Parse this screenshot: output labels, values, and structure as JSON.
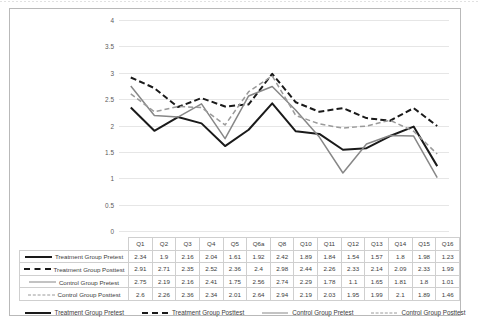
{
  "chart_data": {
    "type": "line",
    "title": "",
    "xlabel": "",
    "ylabel": "",
    "ylim": [
      0,
      4
    ],
    "yticks": [
      "0",
      "0.5",
      "1",
      "1.5",
      "2",
      "2.5",
      "3",
      "3.5",
      "4"
    ],
    "grid": true,
    "legend_position": "bottom",
    "categories": [
      "Q1",
      "Q2",
      "Q3",
      "Q4",
      "Q5",
      "Q6a",
      "Q8",
      "Q10",
      "Q11",
      "Q12",
      "Q13",
      "Q14",
      "Q15",
      "Q16"
    ],
    "series": [
      {
        "name": "Treatment Group Pretest",
        "style": "solid",
        "color": "#1a1a1a",
        "values": [
          2.34,
          1.9,
          2.16,
          2.04,
          1.61,
          1.92,
          2.42,
          1.89,
          1.84,
          1.54,
          1.57,
          1.8,
          1.98,
          1.23
        ]
      },
      {
        "name": "Treatment Group Posttest",
        "style": "dashed",
        "color": "#1a1a1a",
        "values": [
          2.91,
          2.71,
          2.35,
          2.52,
          2.36,
          2.4,
          2.98,
          2.44,
          2.26,
          2.33,
          2.14,
          2.09,
          2.33,
          1.99
        ]
      },
      {
        "name": "Control Group Pretest",
        "style": "solid",
        "color": "#878787",
        "values": [
          2.75,
          2.19,
          2.16,
          2.41,
          1.75,
          2.56,
          2.74,
          2.29,
          1.78,
          1.1,
          1.65,
          1.81,
          1.8,
          1.01
        ]
      },
      {
        "name": "Control Group Posttest",
        "style": "dashed",
        "color": "#9a9a9a",
        "values": [
          2.6,
          2.26,
          2.36,
          2.34,
          2.01,
          2.64,
          2.94,
          2.19,
          2.03,
          1.95,
          1.99,
          2.1,
          1.89,
          1.46
        ]
      }
    ]
  },
  "legend": {
    "items": [
      {
        "label": "Treatment Group Pretest"
      },
      {
        "label": "Treatment Group Posttest"
      },
      {
        "label": "Control Group Pretest"
      },
      {
        "label": "Control Group Posttest"
      }
    ]
  }
}
